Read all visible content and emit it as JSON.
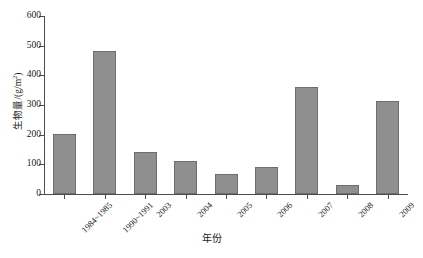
{
  "chart_data": {
    "type": "bar",
    "title": "",
    "xlabel": "年份",
    "ylabel": "生物量/(g/m2)",
    "ylabel_base": "生物量/(g/m",
    "ylabel_sup": "2",
    "ylabel_tail": ")",
    "categories": [
      "1984~1985",
      "1990~1991",
      "2003",
      "2004",
      "2005",
      "2006",
      "2007",
      "2008",
      "2009"
    ],
    "values": [
      202,
      482,
      141,
      111,
      68,
      91,
      361,
      30,
      313
    ],
    "ylim": [
      0,
      600
    ],
    "yticks": [
      0,
      100,
      200,
      300,
      400,
      500,
      600
    ],
    "ytick_labels": [
      "0",
      "100",
      "200",
      "300",
      "400",
      "500",
      "600"
    ],
    "grid": false,
    "legend": null,
    "bar_color": "#8f8f8f",
    "bar_edge_color": "#6e6e6e",
    "axis_color": "#4d4d4d",
    "background_color": "#ffffff",
    "series": [
      {
        "name": "生物量",
        "values": [
          202,
          482,
          141,
          111,
          68,
          91,
          361,
          30,
          313
        ]
      }
    ]
  }
}
